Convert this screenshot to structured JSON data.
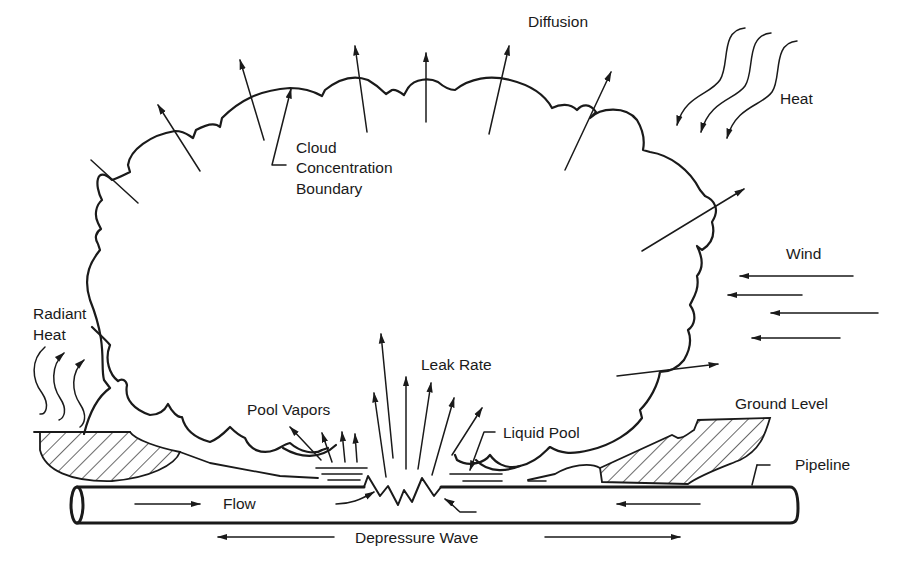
{
  "diagram": {
    "labels": {
      "diffusion": "Diffusion",
      "heat": "Heat",
      "cloud_boundary": [
        "Cloud",
        "Concentration",
        "Boundary"
      ],
      "wind": "Wind",
      "radiant_heat": [
        "Radiant",
        "Heat"
      ],
      "leak_rate": "Leak Rate",
      "pool_vapors": "Pool Vapors",
      "liquid_pool": "Liquid Pool",
      "ground_level": "Ground Level",
      "pipeline": "Pipeline",
      "flow": "Flow",
      "depressure_wave": "Depressure Wave"
    },
    "colors": {
      "ink": "#1a1a1a",
      "background": "#ffffff"
    }
  }
}
